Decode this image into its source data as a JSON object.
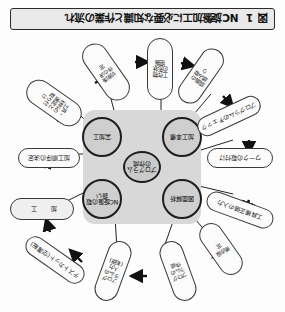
{
  "figure": {
    "number": "図 1",
    "caption": "NC旋盤加工に必要な知識と作業の流れ",
    "orientation": "rotated-180",
    "colors": {
      "panel": "#d8d8d8",
      "node_fill": "#cfcfcf",
      "node_stroke": "#1d1d1d",
      "pill_fill": "#fbfbfb",
      "pill_stroke": "#3a3a3a",
      "caption_fill": "#e9e9e9",
      "arrow": "#111111"
    }
  },
  "core": {
    "center": {
      "label": "プログラムの作成"
    },
    "nodes": [
      {
        "id": "node-zumen",
        "label": "図面解析"
      },
      {
        "id": "node-nc",
        "label": "NC旋盤の取扱い"
      },
      {
        "id": "node-kakou",
        "label": "加工準備"
      },
      {
        "id": "node-jikkou",
        "label": "実加工"
      }
    ]
  },
  "flow": {
    "steps": [
      {
        "id": "step-01",
        "label": "図面の読み取り"
      },
      {
        "id": "step-02",
        "label": "工作物の形状把握"
      },
      {
        "id": "step-03",
        "label": "加工順序の決定"
      },
      {
        "id": "step-04",
        "label": "工具・材料の選定と取り付け"
      },
      {
        "id": "step-05",
        "label": "切削条件の決定"
      },
      {
        "id": "step-06",
        "label": "プログラムの作成"
      },
      {
        "id": "step-07",
        "label": "プログラムのチェック"
      },
      {
        "id": "step-08",
        "label": "ワークの取付け"
      },
      {
        "id": "step-09",
        "label": "工具補正値の入力"
      },
      {
        "id": "step-10",
        "label": "原点設定"
      },
      {
        "id": "step-11",
        "label": "プログラムの入力(転送)"
      },
      {
        "id": "step-12",
        "label": "テストカット(空運転)"
      },
      {
        "id": "step-13",
        "label": "加　工"
      }
    ]
  },
  "connectors": {
    "arrow_glyph": "➜",
    "count": 12
  }
}
